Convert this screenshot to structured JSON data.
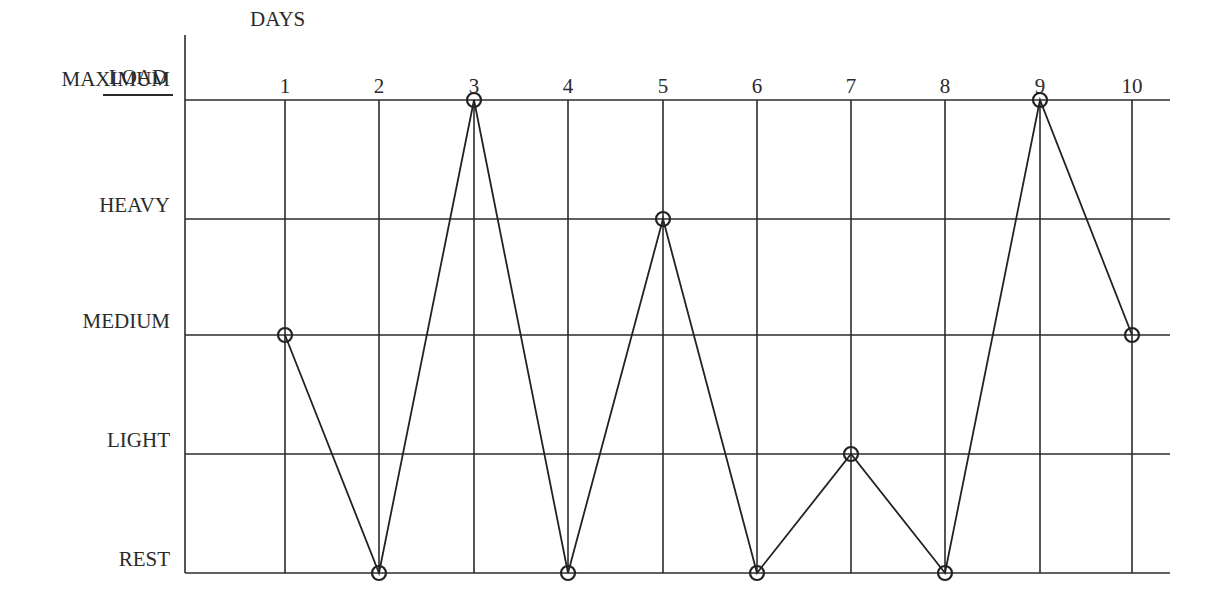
{
  "chart_data": {
    "type": "line",
    "title": "",
    "xlabel": "DAYS",
    "ylabel": "LOAD",
    "categories": [
      "1",
      "2",
      "3",
      "4",
      "5",
      "6",
      "7",
      "8",
      "9",
      "10"
    ],
    "y_levels": [
      "REST",
      "LIGHT",
      "MEDIUM",
      "HEAVY",
      "MAXIMUM"
    ],
    "series": [
      {
        "name": "Load",
        "values": [
          "MEDIUM",
          "REST",
          "MAXIMUM",
          "REST",
          "HEAVY",
          "REST",
          "LIGHT",
          "REST",
          "MAXIMUM",
          "MEDIUM"
        ],
        "numeric_values": [
          2,
          0,
          4,
          0,
          3,
          0,
          1,
          0,
          4,
          2
        ]
      }
    ],
    "ylim": [
      0,
      4
    ],
    "grid": true,
    "legend": null,
    "marker": "circle"
  },
  "labels": {
    "y_axis_title": "LOAD",
    "x_axis_title": "DAYS"
  }
}
